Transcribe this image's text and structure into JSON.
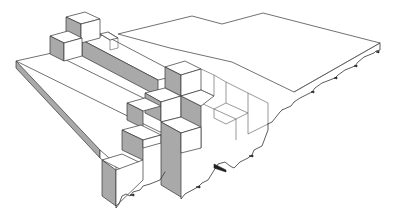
{
  "diagram": {
    "type": "isometric-architectural-line-drawing",
    "colors": {
      "background": "#ffffff",
      "line": "#333333",
      "shaded_face": "#a9a9a9",
      "lit_face": "#ffffff"
    },
    "labels": []
  }
}
